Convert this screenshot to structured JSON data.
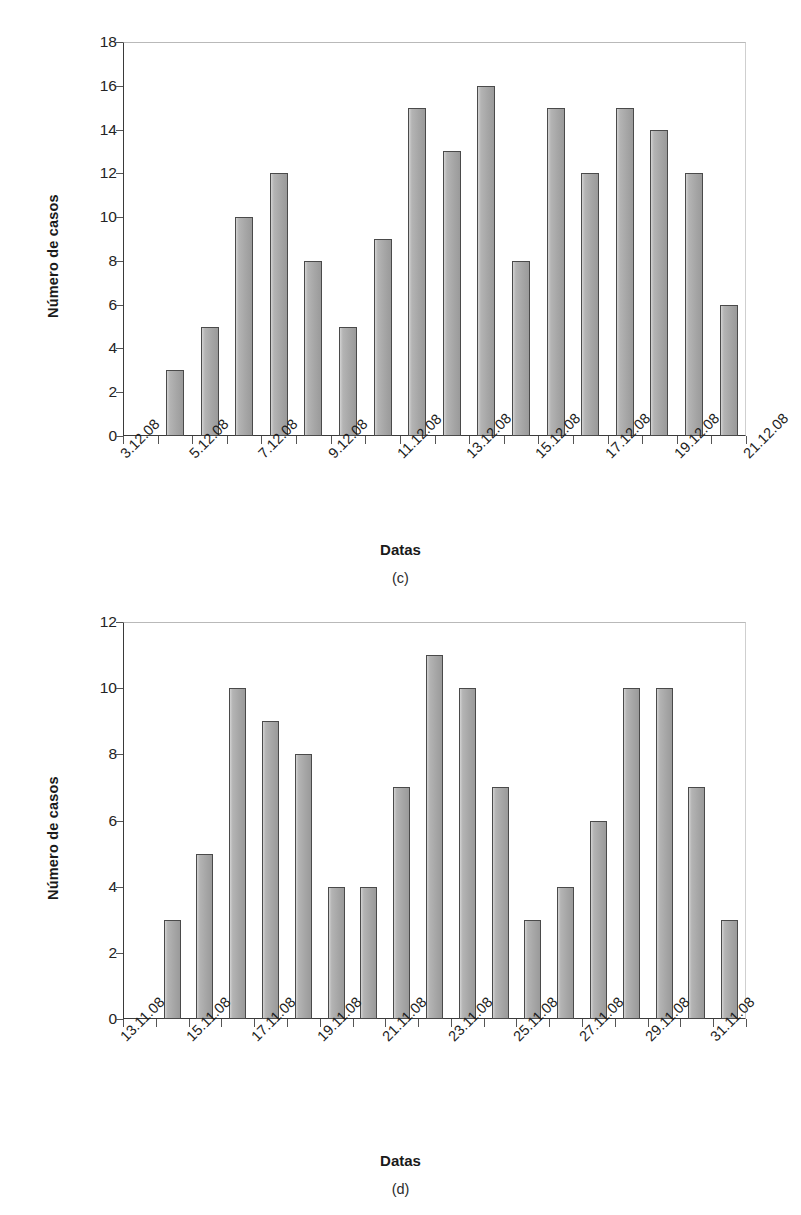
{
  "figures": [
    {
      "id": "c",
      "caption": "(c)",
      "chart": {
        "ylabel": "Número de casos",
        "xlabel": "Datas"
      }
    },
    {
      "id": "d",
      "caption": "(d)",
      "chart": {
        "ylabel": "Número de casos",
        "xlabel": "Datas"
      }
    }
  ],
  "chart_data": [
    {
      "type": "bar",
      "panel": "(c)",
      "title": "",
      "xlabel": "Datas",
      "ylabel": "Número de casos",
      "ylim": [
        0,
        18
      ],
      "yticks": [
        0,
        2,
        4,
        6,
        8,
        10,
        12,
        14,
        16,
        18
      ],
      "ytick_labels": [
        "0",
        "2",
        "4",
        "6",
        "8",
        "10",
        "12",
        "14",
        "16",
        "18"
      ],
      "xtick_labels": [
        "3.12.08",
        "5.12.08",
        "7.12.08",
        "9.12.08",
        "11.12.08",
        "13.12.08",
        "15.12.08",
        "17.12.08",
        "19.12.08",
        "21.12.08"
      ],
      "xtick_step_days": 2,
      "grid": false,
      "legend": false,
      "bar_color": "#a8a8a8",
      "bar_edge_color": "#4a4a4a",
      "categories": [
        "4.12.08",
        "5.12.08",
        "6.12.08",
        "7.12.08",
        "8.12.08",
        "9.12.08",
        "10.12.08",
        "11.12.08",
        "12.12.08",
        "13.12.08",
        "14.12.08",
        "15.12.08",
        "16.12.08",
        "17.12.08",
        "18.12.08",
        "19.12.08",
        "20.12.08"
      ],
      "values": [
        3,
        5,
        10,
        12,
        8,
        5,
        9,
        15,
        13,
        16,
        8,
        15,
        12,
        15,
        14,
        12,
        6
      ]
    },
    {
      "type": "bar",
      "panel": "(d)",
      "title": "",
      "xlabel": "Datas",
      "ylabel": "Número de casos",
      "ylim": [
        0,
        12
      ],
      "yticks": [
        0,
        2,
        4,
        6,
        8,
        10,
        12
      ],
      "ytick_labels": [
        "0",
        "2",
        "4",
        "6",
        "8",
        "10",
        "12"
      ],
      "xtick_labels": [
        "13.11.08",
        "15.11.08",
        "17.11.08",
        "19.11.08",
        "21.11.08",
        "23.11.08",
        "25.11.08",
        "27.11.08",
        "29.11.08",
        "31.11.08"
      ],
      "xtick_step_days": 2,
      "grid": false,
      "legend": false,
      "bar_color": "#a8a8a8",
      "bar_edge_color": "#4a4a4a",
      "categories": [
        "14.11.08",
        "15.11.08",
        "16.11.08",
        "17.11.08",
        "18.11.08",
        "19.11.08",
        "20.11.08",
        "21.11.08",
        "22.11.08",
        "23.11.08",
        "24.11.08",
        "25.11.08",
        "26.11.08",
        "27.11.08",
        "28.11.08",
        "29.11.08",
        "30.11.08"
      ],
      "values": [
        3,
        5,
        10,
        9,
        8,
        4,
        4,
        7,
        11,
        10,
        7,
        3,
        4,
        6,
        10,
        10,
        7,
        3
      ]
    }
  ]
}
